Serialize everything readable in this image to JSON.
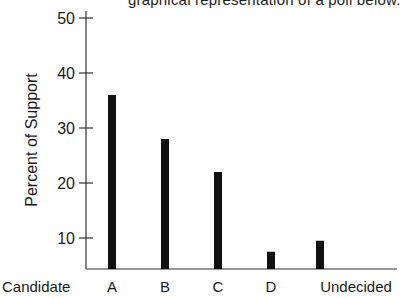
{
  "caption_fragment": "graphical representation of a poll below.",
  "chart_data": {
    "type": "bar",
    "title": "",
    "xlabel": "Candidate",
    "ylabel": "Percent of Support",
    "categories": [
      "A",
      "B",
      "C",
      "D",
      "Undecided"
    ],
    "values": [
      36,
      28,
      22,
      7.5,
      9.5
    ],
    "yticks": [
      10,
      20,
      30,
      40,
      50
    ],
    "ylim": [
      5.6,
      50
    ],
    "grid": false,
    "legend": null,
    "colors": {
      "bar": "#111111",
      "axis": "#333333",
      "text": "#1a1a1a"
    }
  }
}
